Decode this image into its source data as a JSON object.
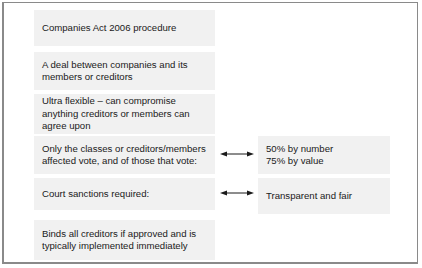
{
  "diagram": {
    "left_boxes": [
      {
        "text": "Companies Act 2006 procedure"
      },
      {
        "text": "A deal between companies and its\nmembers or creditors"
      },
      {
        "text": "Ultra flexible – can compromise\nanything creditors or members can\nagree upon"
      },
      {
        "text": "Only the classes or creditors/members\naffected vote, and of those that vote:"
      },
      {
        "text": "Court sanctions required:"
      },
      {
        "text": "Binds all creditors if approved and is\ntypically implemented immediately"
      }
    ],
    "right_boxes": [
      {
        "text": "50% by number\n75% by value"
      },
      {
        "text": "Transparent and fair"
      }
    ],
    "connectors": [
      {
        "from": "left_boxes.3",
        "to": "right_boxes.0",
        "icon": "double-headed-arrow"
      },
      {
        "from": "left_boxes.4",
        "to": "right_boxes.1",
        "icon": "double-headed-arrow"
      }
    ]
  }
}
